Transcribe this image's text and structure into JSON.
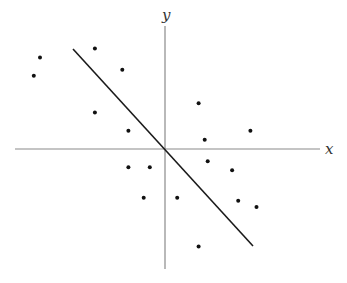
{
  "chart_data": {
    "type": "scatter",
    "title": "",
    "xlabel": "x",
    "ylabel": "y",
    "grid": false,
    "legend": null,
    "axes_style": "cross-through-origin, no ticks",
    "xlim": [
      -6,
      5.5
    ],
    "ylim": [
      -4.3,
      4.4
    ],
    "points": [
      {
        "x": -4.1,
        "y": 3.0
      },
      {
        "x": -4.3,
        "y": 2.4
      },
      {
        "x": -2.3,
        "y": 3.3
      },
      {
        "x": -1.4,
        "y": 2.6
      },
      {
        "x": -2.3,
        "y": 1.2
      },
      {
        "x": -1.2,
        "y": 0.6
      },
      {
        "x": 1.1,
        "y": 1.5
      },
      {
        "x": 2.8,
        "y": 0.6
      },
      {
        "x": 1.3,
        "y": 0.3
      },
      {
        "x": 1.4,
        "y": -0.4
      },
      {
        "x": 2.2,
        "y": -0.7
      },
      {
        "x": -1.2,
        "y": -0.6
      },
      {
        "x": -0.5,
        "y": -0.6
      },
      {
        "x": 0.4,
        "y": -1.6
      },
      {
        "x": 2.4,
        "y": -1.7
      },
      {
        "x": 3.0,
        "y": -1.9
      },
      {
        "x": -0.7,
        "y": -1.6
      },
      {
        "x": 1.1,
        "y": -3.2
      }
    ],
    "fit_line": {
      "x": [
        -3.1,
        2.9
      ],
      "y": [
        3.3,
        -3.2
      ],
      "slope": -1.08,
      "intercept": 0
    }
  },
  "labels": {
    "x_axis": "x",
    "y_axis": "y"
  }
}
